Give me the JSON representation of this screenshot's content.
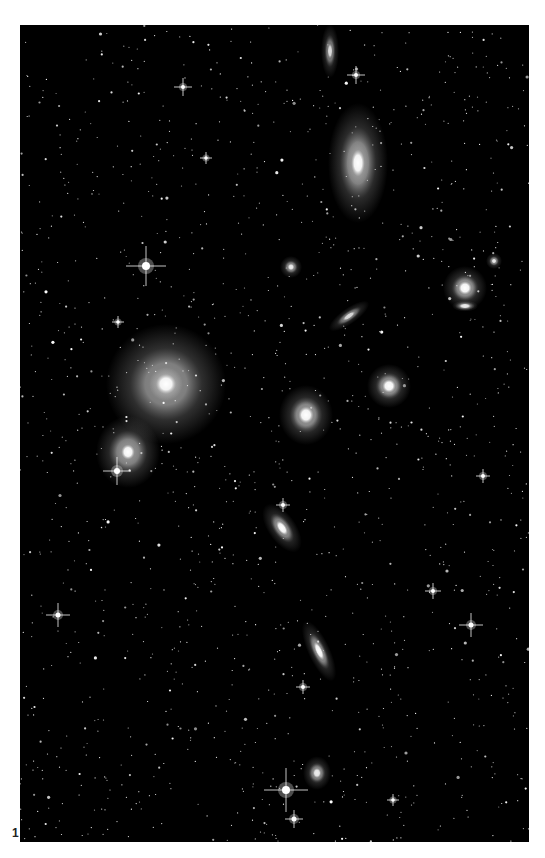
{
  "figure": {
    "label": "1",
    "frame": {
      "x": 20,
      "y": 25,
      "width": 509,
      "height": 817,
      "background": "#000000"
    },
    "star_field_seed": 1337,
    "star_field_count": 1400,
    "galaxies": [
      {
        "name": "giant-elliptical",
        "cx": 146,
        "cy": 359,
        "rx": 12,
        "ry": 12,
        "halo": 48,
        "rot": 0,
        "core": "#ffffff",
        "glow": "#bbbbbb"
      },
      {
        "name": "elliptical-lower-left",
        "cx": 108,
        "cy": 427,
        "rx": 8,
        "ry": 9,
        "halo": 24,
        "rot": 0,
        "core": "#ffffff",
        "glow": "#999999"
      },
      {
        "name": "lenticular-top-right",
        "cx": 338,
        "cy": 138,
        "rx": 8,
        "ry": 16,
        "halo": 22,
        "rot": 0,
        "core": "#ffffff",
        "glow": "#aaaaaa"
      },
      {
        "name": "edge-on-top",
        "cx": 310,
        "cy": 26,
        "rx": 3,
        "ry": 9,
        "halo": 6,
        "rot": 0,
        "core": "#dddddd",
        "glow": "#777777"
      },
      {
        "name": "elliptical-center",
        "cx": 286,
        "cy": 390,
        "rx": 9,
        "ry": 10,
        "halo": 18,
        "rot": 0,
        "core": "#ffffff",
        "glow": "#999999"
      },
      {
        "name": "elliptical-center-right",
        "cx": 369,
        "cy": 361,
        "rx": 8,
        "ry": 8,
        "halo": 14,
        "rot": 0,
        "core": "#ffffff",
        "glow": "#999999"
      },
      {
        "name": "pair-right-upper",
        "cx": 445,
        "cy": 263,
        "rx": 8,
        "ry": 8,
        "halo": 14,
        "rot": 0,
        "core": "#ffffff",
        "glow": "#999999"
      },
      {
        "name": "pair-right-lower",
        "cx": 445,
        "cy": 281,
        "rx": 7,
        "ry": 3,
        "halo": 6,
        "rot": 0,
        "core": "#eeeeee",
        "glow": "#888888"
      },
      {
        "name": "spiral-tilted-center",
        "cx": 329,
        "cy": 291,
        "rx": 3,
        "ry": 9,
        "halo": 5,
        "rot": 55,
        "core": "#dddddd",
        "glow": "#777777"
      },
      {
        "name": "small-elliptical-mid",
        "cx": 271,
        "cy": 242,
        "rx": 4,
        "ry": 4,
        "halo": 7,
        "rot": 0,
        "core": "#eeeeee",
        "glow": "#888888"
      },
      {
        "name": "disk-lower-center",
        "cx": 262,
        "cy": 503,
        "rx": 5,
        "ry": 10,
        "halo": 9,
        "rot": -35,
        "core": "#ffffff",
        "glow": "#888888"
      },
      {
        "name": "edge-on-lower",
        "cx": 299,
        "cy": 626,
        "rx": 4,
        "ry": 12,
        "halo": 7,
        "rot": -25,
        "core": "#ffffff",
        "glow": "#888888"
      },
      {
        "name": "small-elliptical-bottom",
        "cx": 297,
        "cy": 748,
        "rx": 5,
        "ry": 6,
        "halo": 9,
        "rot": 0,
        "core": "#eeeeee",
        "glow": "#888888"
      },
      {
        "name": "small-elliptical-right",
        "cx": 474,
        "cy": 236,
        "rx": 3,
        "ry": 3,
        "halo": 5,
        "rot": 0,
        "core": "#eeeeee",
        "glow": "#888888"
      }
    ],
    "bright_stars": [
      {
        "cx": 126,
        "cy": 241,
        "spike": 20,
        "r": 4
      },
      {
        "cx": 163,
        "cy": 62,
        "spike": 9,
        "r": 2
      },
      {
        "cx": 336,
        "cy": 50,
        "spike": 9,
        "r": 2
      },
      {
        "cx": 97,
        "cy": 446,
        "spike": 14,
        "r": 3
      },
      {
        "cx": 38,
        "cy": 590,
        "spike": 12,
        "r": 2.5
      },
      {
        "cx": 451,
        "cy": 600,
        "spike": 12,
        "r": 2.5
      },
      {
        "cx": 266,
        "cy": 765,
        "spike": 22,
        "r": 4
      },
      {
        "cx": 274,
        "cy": 794,
        "spike": 9,
        "r": 2.5
      },
      {
        "cx": 413,
        "cy": 566,
        "spike": 8,
        "r": 2
      },
      {
        "cx": 263,
        "cy": 480,
        "spike": 7,
        "r": 2
      },
      {
        "cx": 283,
        "cy": 662,
        "spike": 7,
        "r": 2
      },
      {
        "cx": 463,
        "cy": 451,
        "spike": 7,
        "r": 2
      },
      {
        "cx": 186,
        "cy": 133,
        "spike": 6,
        "r": 1.8
      },
      {
        "cx": 98,
        "cy": 297,
        "spike": 6,
        "r": 1.8
      },
      {
        "cx": 373,
        "cy": 775,
        "spike": 6,
        "r": 1.8
      }
    ]
  }
}
